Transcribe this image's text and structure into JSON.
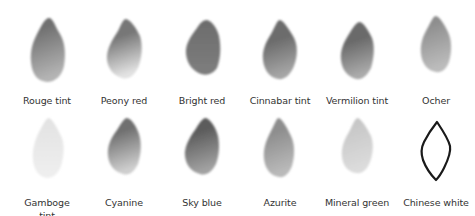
{
  "swatches": [
    {
      "label": "Rouge tint",
      "fill_top": "#6f6f6f",
      "fill_bottom": "#b4b4b4",
      "style": "filled"
    },
    {
      "label": "Peony red",
      "fill_top": "#767676",
      "fill_bottom": "#d8d8d8",
      "style": "filled"
    },
    {
      "label": "Bright red",
      "fill_top": "#6e6e6e",
      "fill_bottom": "#7e7e7e",
      "style": "filled"
    },
    {
      "label": "Cinnabar tint",
      "fill_top": "#6c6c6c",
      "fill_bottom": "#a2a2a2",
      "style": "filled"
    },
    {
      "label": "Vermilion tint",
      "fill_top": "#6c6c6c",
      "fill_bottom": "#a8a8a8",
      "style": "filled"
    },
    {
      "label": "Ocher",
      "fill_top": "#8c8c8c",
      "fill_bottom": "#b8b8b8",
      "style": "filled"
    },
    {
      "label_line1": "Gamboge",
      "label_line2": "tint",
      "fill_top": "#e4e4e4",
      "fill_bottom": "#eeeeee",
      "style": "filled"
    },
    {
      "label": "Cyanine",
      "fill_top": "#707070",
      "fill_bottom": "#c6c6c6",
      "style": "filled"
    },
    {
      "label": "Sky blue",
      "fill_top": "#5e5e5e",
      "fill_bottom": "#9c9c9c",
      "style": "filled"
    },
    {
      "label": "Azurite",
      "fill_top": "#8e8e8e",
      "fill_bottom": "#b6b6b6",
      "style": "filled"
    },
    {
      "label": "Mineral green",
      "fill_top": "#c0c0c0",
      "fill_bottom": "#d8d8d8",
      "style": "filled"
    },
    {
      "label": "Chinese white",
      "stroke": "#1a1a1a",
      "style": "outline"
    }
  ]
}
